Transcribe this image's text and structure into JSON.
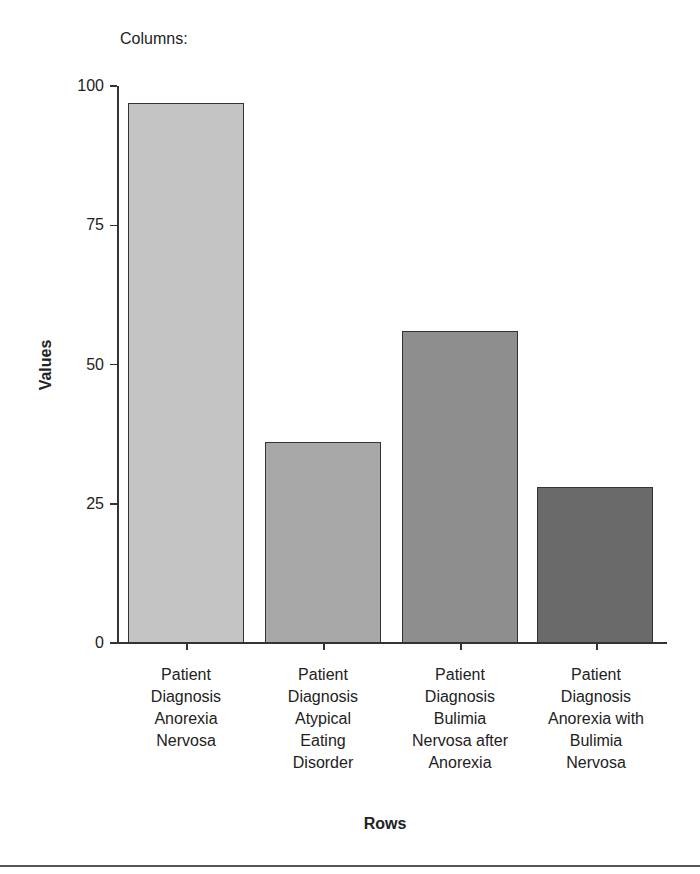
{
  "chart_data": {
    "type": "bar",
    "title": "",
    "legend_title": "Columns:",
    "xlabel": "Rows",
    "ylabel": "Values",
    "ylim": [
      0,
      100
    ],
    "yticks": [
      0,
      25,
      50,
      75,
      100
    ],
    "grid": false,
    "categories": [
      "Patient Diagnosis Anorexia Nervosa",
      "Patient Diagnosis Atypical Eating Disorder",
      "Patient Diagnosis Bulimia Nervosa after Anorexia",
      "Patient Diagnosis Anorexia with Bulimia Nervosa"
    ],
    "values": [
      97,
      36,
      56,
      28
    ],
    "colors": [
      "#c4c4c4",
      "#a8a8a8",
      "#8e8e8e",
      "#6a6a6a"
    ]
  },
  "labels": {
    "columns": "Columns:",
    "y_axis": "Values",
    "x_axis": "Rows",
    "yticks": [
      "0",
      "25",
      "50",
      "75",
      "100"
    ],
    "categories_wrapped": [
      "Patient\nDiagnosis\nAnorexia\nNervosa",
      "Patient\nDiagnosis\nAtypical\nEating\nDisorder",
      "Patient\nDiagnosis\nBulimia\nNervosa after\nAnorexia",
      "Patient\nDiagnosis\nAnorexia with\nBulimia\nNervosa"
    ]
  }
}
